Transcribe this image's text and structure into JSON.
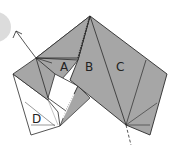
{
  "diagram": {
    "type": "origami-fold-step",
    "labels": {
      "a": "A",
      "b": "B",
      "c": "C",
      "d": "D"
    },
    "colors": {
      "paper_colored": "#a6a6a6",
      "paper_white": "#ffffff",
      "line": "#2a2a2a",
      "circle": "#d9d9d9"
    },
    "annotations": {
      "arrow": "fold-direction-arrow",
      "dashed_line": "fold-line"
    }
  }
}
